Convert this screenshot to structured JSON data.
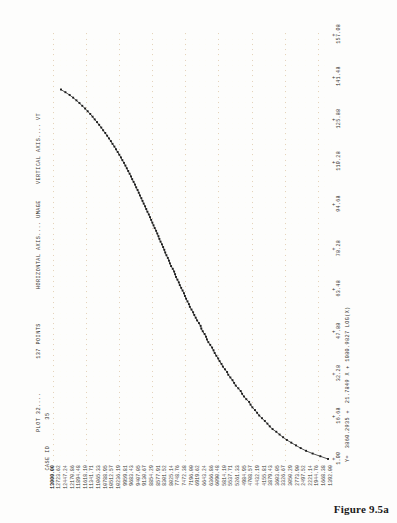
{
  "figure": {
    "caption": "Figure 9.5a"
  },
  "header": {
    "plot_label": "PLOT 32....",
    "points_label": "137 POINTS",
    "horizontal_axis_label": "HORIZONTAL AXIS.... UMAGE",
    "vertical_axis_label": "VERTICAL AXIS.... VT",
    "case_id_label": "CASE ID",
    "case_id_value": "35"
  },
  "equation": "Y=  3860.2935 +  21.7849 X + 1080.9827 LOG(X)",
  "chart_data": {
    "type": "line",
    "xlabel": "HORIZONTAL AXIS.... UMAGE",
    "ylabel": "VERTICAL AXIS.... VT",
    "grid": true,
    "legend": "none",
    "xlim": [
      1.0,
      157.08
    ],
    "ylim": [
      1392.0,
      13000.0
    ],
    "xticks": [
      "1.00",
      "16.68",
      "32.28",
      "47.88",
      "63.48",
      "78.28",
      "94.68",
      "110.28",
      "125.88",
      "141.48",
      "157.08"
    ],
    "ytick_labels": [
      "13000.00",
      "12723.62",
      "12447.24",
      "12170.86",
      "11894.48",
      "11618.10",
      "11341.71",
      "11065.33",
      "10788.95",
      "10512.57",
      "10236.19",
      "9959.81",
      "9683.43",
      "9407.05",
      "9130.67",
      "8854.29",
      "8577.91",
      "8301.52",
      "8025.14",
      "7748.76",
      "7472.38",
      "7196.00",
      "6919.62",
      "6643.24",
      "6366.86",
      "6090.48",
      "5814.10",
      "5537.71",
      "5261.33",
      "4984.95",
      "4708.57",
      "4432.19",
      "4155.81",
      "3879.43",
      "3603.05",
      "3326.67",
      "3050.29",
      "2773.90",
      "2497.52",
      "2221.14",
      "1944.76",
      "1668.38",
      "1392.00"
    ],
    "ytick_bold_index": 0,
    "ytick_major_indices": [
      0,
      5,
      10,
      15,
      20,
      25,
      30,
      35,
      40
    ],
    "n_points": 137,
    "x": [
      1,
      2,
      3,
      4,
      5,
      6,
      7,
      8,
      9,
      10,
      11,
      12,
      13,
      14,
      15,
      16,
      17,
      18,
      19,
      20,
      21,
      22,
      23,
      24,
      25,
      26,
      27,
      28,
      29,
      30,
      31,
      32,
      33,
      34,
      35,
      36,
      37,
      38,
      39,
      40,
      41,
      42,
      43,
      44,
      45,
      46,
      47,
      48,
      49,
      50,
      51,
      52,
      53,
      54,
      55,
      56,
      57,
      58,
      59,
      60,
      61,
      62,
      63,
      64,
      65,
      66,
      67,
      68,
      69,
      70,
      71,
      72,
      73,
      74,
      75,
      76,
      77,
      78,
      79,
      80,
      81,
      82,
      83,
      84,
      85,
      86,
      87,
      88,
      89,
      90,
      91,
      92,
      93,
      94,
      95,
      96,
      97,
      98,
      99,
      100,
      101,
      102,
      103,
      104,
      105,
      106,
      107,
      108,
      109,
      110,
      111,
      112,
      113,
      114,
      115,
      116,
      117,
      118,
      119,
      120,
      121,
      122,
      123,
      124,
      125,
      126,
      127,
      128,
      129,
      130,
      131,
      132,
      133,
      134,
      135,
      136,
      137
    ],
    "y": [
      1392,
      1720,
      2050,
      2330,
      2560,
      2760,
      2960,
      3150,
      3310,
      3460,
      3600,
      3760,
      3880,
      3980,
      4090,
      4210,
      4330,
      4420,
      4510,
      4620,
      4700,
      4760,
      4880,
      4980,
      5060,
      5120,
      5220,
      5330,
      5400,
      5470,
      5560,
      5650,
      5700,
      5790,
      5880,
      5940,
      6020,
      6080,
      6160,
      6230,
      6280,
      6340,
      6420,
      6500,
      6560,
      6600,
      6660,
      6740,
      6800,
      6830,
      6900,
      6980,
      7040,
      7100,
      7150,
      7220,
      7290,
      7330,
      7390,
      7450,
      7500,
      7540,
      7600,
      7660,
      7720,
      7760,
      7820,
      7880,
      7920,
      7960,
      8020,
      8090,
      8140,
      8180,
      8230,
      8290,
      8340,
      8380,
      8430,
      8480,
      8540,
      8590,
      8630,
      8680,
      8730,
      8790,
      8840,
      8890,
      8940,
      8990,
      9040,
      9100,
      9150,
      9200,
      9260,
      9310,
      9360,
      9420,
      9470,
      9520,
      9580,
      9630,
      9690,
      9750,
      9800,
      9860,
      9920,
      9980,
      10040,
      10100,
      10170,
      10230,
      10300,
      10370,
      10440,
      10510,
      10590,
      10660,
      10740,
      10820,
      10900,
      10990,
      11070,
      11160,
      11250,
      11350,
      11440,
      11540,
      11650,
      11760,
      11880,
      12000,
      12130,
      12270,
      12420,
      12600,
      12790
    ]
  }
}
